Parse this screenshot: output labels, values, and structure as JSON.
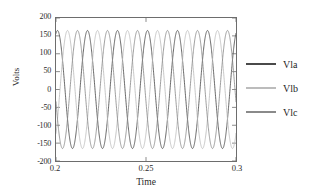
{
  "chart_data": {
    "type": "line",
    "title": "",
    "xlabel": "Time",
    "ylabel": "Volts",
    "xlim": [
      0.2,
      0.3
    ],
    "ylim": [
      -200,
      200
    ],
    "grid": false,
    "legend_position": "right",
    "x_ticks": [
      "0.2",
      "0.25",
      "0.3"
    ],
    "x_tick_values": [
      0.2,
      0.25,
      0.3
    ],
    "y_ticks": [
      "200",
      "150",
      "100",
      "50",
      "0",
      "-50",
      "-100",
      "-150",
      "-200"
    ],
    "y_tick_values": [
      200,
      150,
      100,
      50,
      0,
      -50,
      -100,
      -150,
      -200
    ],
    "waveform": {
      "amplitude": 165,
      "frequency_hz": 60,
      "cycles_in_view": 6,
      "phase_offsets_deg": [
        0,
        -120,
        120
      ],
      "start_phase_deg": 72
    },
    "series": [
      {
        "name": "Vla",
        "color": "#4a4a4a",
        "amplitude": 165,
        "frequency_hz": 60,
        "phase_deg": 0
      },
      {
        "name": "Vlb",
        "color": "#bcbcbc",
        "amplitude": 165,
        "frequency_hz": 60,
        "phase_deg": -120
      },
      {
        "name": "Vlc",
        "color": "#8a8a8a",
        "amplitude": 165,
        "frequency_hz": 60,
        "phase_deg": 120
      }
    ],
    "axis_color": "#6d6d6d"
  },
  "legend": {
    "items": [
      {
        "label": "Vla"
      },
      {
        "label": "Vlb"
      },
      {
        "label": "Vlc"
      }
    ]
  }
}
